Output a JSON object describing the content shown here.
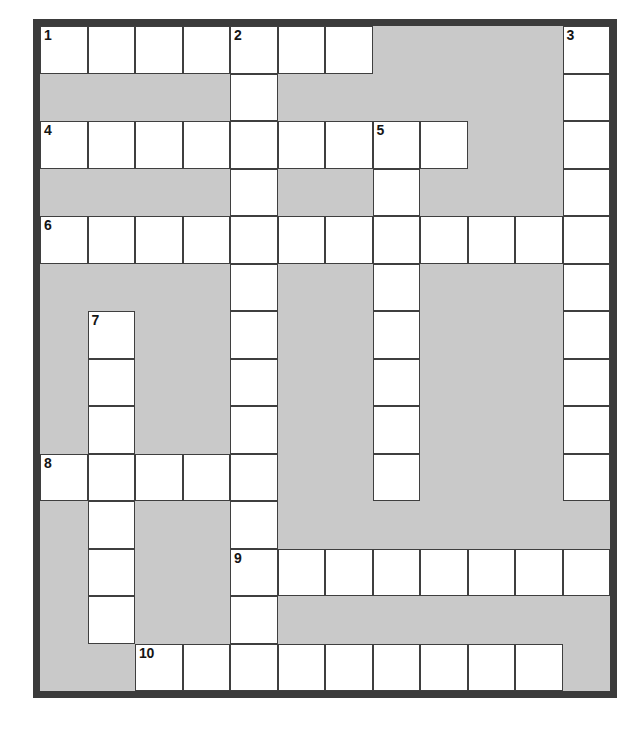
{
  "page": {
    "width": 637,
    "height": 745,
    "background_color": "#ffffff"
  },
  "margin_text_fragments": [
    {
      "text": "s;",
      "top": 172
    },
    {
      "text": "e",
      "top": 228
    }
  ],
  "puzzle": {
    "title": "Crossword Puzzle Grid",
    "type": "crossword",
    "columns": 12,
    "rows": 14,
    "cell_size": 47.5,
    "colors": {
      "block": "#c9c9c9",
      "open_cell": "#ffffff",
      "cell_border": "#3f3f3f",
      "frame": "#3b3b3b",
      "number": "#151515"
    },
    "frame_thickness": 7,
    "clue_numbers": [
      1,
      2,
      3,
      4,
      5,
      6,
      7,
      8,
      9,
      10
    ],
    "number_positions": [
      {
        "number": 1,
        "row": 1,
        "col": 1
      },
      {
        "number": 2,
        "row": 1,
        "col": 5
      },
      {
        "number": 3,
        "row": 1,
        "col": 12
      },
      {
        "number": 4,
        "row": 3,
        "col": 1
      },
      {
        "number": 5,
        "row": 3,
        "col": 8
      },
      {
        "number": 6,
        "row": 5,
        "col": 1
      },
      {
        "number": 7,
        "row": 7,
        "col": 2
      },
      {
        "number": 8,
        "row": 10,
        "col": 1
      },
      {
        "number": 9,
        "row": 12,
        "col": 5
      },
      {
        "number": 10,
        "row": 14,
        "col": 3
      }
    ],
    "grid": [
      [
        "open",
        "open",
        "open",
        "open",
        "open",
        "open",
        "open",
        "block",
        "block",
        "block",
        "block",
        "open"
      ],
      [
        "block",
        "block",
        "block",
        "block",
        "open",
        "block",
        "block",
        "block",
        "block",
        "block",
        "block",
        "open"
      ],
      [
        "open",
        "open",
        "open",
        "open",
        "open",
        "open",
        "open",
        "open",
        "open",
        "block",
        "block",
        "open"
      ],
      [
        "block",
        "block",
        "block",
        "block",
        "open",
        "block",
        "block",
        "open",
        "block",
        "block",
        "block",
        "open"
      ],
      [
        "open",
        "open",
        "open",
        "open",
        "open",
        "open",
        "open",
        "open",
        "open",
        "open",
        "open",
        "open"
      ],
      [
        "block",
        "block",
        "block",
        "block",
        "open",
        "block",
        "block",
        "open",
        "block",
        "block",
        "block",
        "open"
      ],
      [
        "block",
        "open",
        "block",
        "block",
        "open",
        "block",
        "block",
        "open",
        "block",
        "block",
        "block",
        "open"
      ],
      [
        "block",
        "open",
        "block",
        "block",
        "open",
        "block",
        "block",
        "open",
        "block",
        "block",
        "block",
        "open"
      ],
      [
        "block",
        "open",
        "block",
        "block",
        "open",
        "block",
        "block",
        "open",
        "block",
        "block",
        "block",
        "open"
      ],
      [
        "open",
        "open",
        "open",
        "open",
        "open",
        "block",
        "block",
        "open",
        "block",
        "block",
        "block",
        "open"
      ],
      [
        "block",
        "open",
        "block",
        "block",
        "open",
        "block",
        "block",
        "block",
        "block",
        "block",
        "block",
        "block"
      ],
      [
        "block",
        "open",
        "block",
        "block",
        "open",
        "open",
        "open",
        "open",
        "open",
        "open",
        "open",
        "open"
      ],
      [
        "block",
        "open",
        "block",
        "block",
        "open",
        "block",
        "block",
        "block",
        "block",
        "block",
        "block",
        "block"
      ],
      [
        "block",
        "block",
        "open",
        "open",
        "open",
        "open",
        "open",
        "open",
        "open",
        "open",
        "open",
        "block"
      ]
    ],
    "entries": {
      "across": [
        {
          "number": 1,
          "row": 1,
          "col": 1,
          "length": 7
        },
        {
          "number": 4,
          "row": 3,
          "col": 1,
          "length": 9
        },
        {
          "number": 6,
          "row": 5,
          "col": 1,
          "length": 12
        },
        {
          "number": 8,
          "row": 10,
          "col": 1,
          "length": 5
        },
        {
          "number": 9,
          "row": 12,
          "col": 5,
          "length": 8
        },
        {
          "number": 10,
          "row": 14,
          "col": 3,
          "length": 9
        }
      ],
      "down": [
        {
          "number": 1,
          "row": 1,
          "col": 1,
          "length": 1
        },
        {
          "number": 2,
          "row": 1,
          "col": 5,
          "length": 14
        },
        {
          "number": 3,
          "row": 1,
          "col": 12,
          "length": 10
        },
        {
          "number": 5,
          "row": 3,
          "col": 8,
          "length": 8
        },
        {
          "number": 7,
          "row": 7,
          "col": 2,
          "length": 7
        }
      ]
    }
  }
}
